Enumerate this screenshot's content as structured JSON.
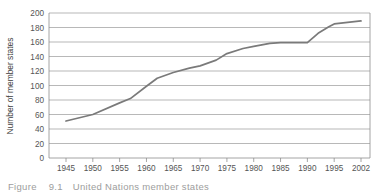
{
  "figure": {
    "caption_label": "Figure",
    "caption_number": "9.1",
    "caption_text": "United Nations member states"
  },
  "chart_data": {
    "type": "line",
    "title": "",
    "xlabel": "",
    "ylabel": "Number of member states",
    "xlim": [
      1945,
      2002
    ],
    "ylim": [
      0,
      200
    ],
    "grid": true,
    "legend": "none",
    "y_ticks": [
      0,
      20,
      40,
      60,
      80,
      100,
      120,
      140,
      160,
      180,
      200
    ],
    "y_tick_labels": [
      "0",
      "20",
      "40",
      "60",
      "80",
      "100",
      "120",
      "140",
      "160",
      "180",
      "200"
    ],
    "x_ticks": [
      1945,
      1950,
      1955,
      1960,
      1965,
      1970,
      1975,
      1980,
      1985,
      1990,
      1995,
      2002
    ],
    "x_tick_labels": [
      "1945",
      "1950",
      "1955",
      "1960",
      "1965",
      "1970",
      "1975",
      "1980",
      "1985",
      "1990",
      "1995",
      "2002"
    ],
    "line_color": "#7a7a7a",
    "grid_color": "#9a9a9a",
    "series": [
      {
        "name": "Number of member states",
        "x": [
          1945,
          1950,
          1955,
          1957,
          1960,
          1962,
          1965,
          1968,
          1970,
          1973,
          1975,
          1978,
          1980,
          1983,
          1985,
          1990,
          1992,
          1994,
          1995,
          2002
        ],
        "values": [
          51,
          60,
          76,
          82,
          99,
          110,
          118,
          124,
          127,
          135,
          144,
          151,
          154,
          158,
          159,
          159,
          172,
          181,
          185,
          189
        ]
      }
    ]
  }
}
